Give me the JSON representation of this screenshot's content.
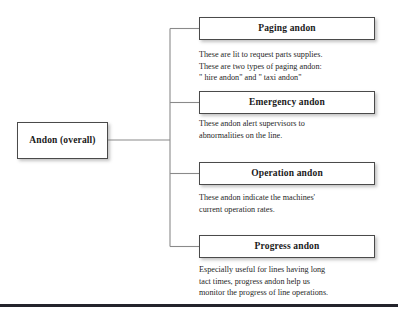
{
  "diagram": {
    "type": "tree",
    "root": {
      "label": "Andon (overall)"
    },
    "branches": [
      {
        "label": "Paging andon",
        "description_lines": [
          "These are lit to request parts supplies.",
          "These are two types of paging andon:",
          "\" hire andon\" and \" taxi andon\""
        ]
      },
      {
        "label": "Emergency andon",
        "description_lines": [
          "These andon alert supervisors to",
          "abnormalities on the line."
        ]
      },
      {
        "label": "Operation andon",
        "description_lines": [
          "These andon indicate the machines'",
          "current operation rates."
        ]
      },
      {
        "label": "Progress andon",
        "description_lines": [
          "Especially useful for lines having long",
          "tact times, progress andon help us",
          "monitor the progress of line operations."
        ]
      }
    ],
    "colors": {
      "box_border": "#4a4a4a",
      "connector": "#808080",
      "text": "#1a1a1a",
      "rule": "#23232b",
      "background": "#ffffff"
    }
  }
}
